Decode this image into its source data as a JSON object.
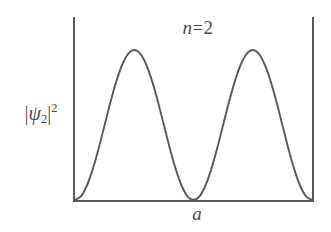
{
  "figure": {
    "title_variable": "n",
    "title_equals": "=",
    "title_value": "2",
    "y_axis_label_open_bar": "|",
    "y_axis_label_psi": "ψ",
    "y_axis_label_subscript": "2",
    "y_axis_label_close_bar": "|",
    "y_axis_label_exponent": "2",
    "x_axis_label": "a",
    "line_color": "#5a5a5a",
    "axis_color": "#595959",
    "background_color": "#ffffff"
  },
  "chart_data": {
    "type": "line",
    "xlabel": "a",
    "ylabel": "|ψ₂|²",
    "grid": false,
    "legend": null,
    "xlim": [
      0,
      1
    ],
    "ylim": [
      0,
      1
    ],
    "x_tick_labels": [
      "a"
    ],
    "x_tick_values": [
      1
    ],
    "y_tick_labels": [],
    "function": "sin^2(2*pi*x/a)",
    "series": [
      {
        "name": "|psi_2|^2",
        "x": [
          0.0,
          0.025,
          0.05,
          0.075,
          0.1,
          0.125,
          0.15,
          0.175,
          0.2,
          0.225,
          0.25,
          0.275,
          0.3,
          0.325,
          0.35,
          0.375,
          0.4,
          0.425,
          0.45,
          0.475,
          0.5,
          0.525,
          0.55,
          0.575,
          0.6,
          0.625,
          0.65,
          0.675,
          0.7,
          0.725,
          0.75,
          0.775,
          0.8,
          0.825,
          0.85,
          0.875,
          0.9,
          0.925,
          0.95,
          0.975,
          1.0
        ],
        "y": [
          0.0,
          0.024,
          0.095,
          0.206,
          0.345,
          0.5,
          0.655,
          0.794,
          0.905,
          0.976,
          1.0,
          0.976,
          0.905,
          0.794,
          0.655,
          0.5,
          0.345,
          0.206,
          0.095,
          0.024,
          0.0,
          0.024,
          0.095,
          0.206,
          0.345,
          0.5,
          0.655,
          0.794,
          0.905,
          0.976,
          1.0,
          0.976,
          0.905,
          0.794,
          0.655,
          0.5,
          0.345,
          0.206,
          0.095,
          0.024,
          0.0
        ]
      }
    ],
    "nodes": [
      0.0,
      0.5,
      1.0
    ],
    "maxima": [
      0.25,
      0.75
    ],
    "n_quantum_number": 2
  }
}
